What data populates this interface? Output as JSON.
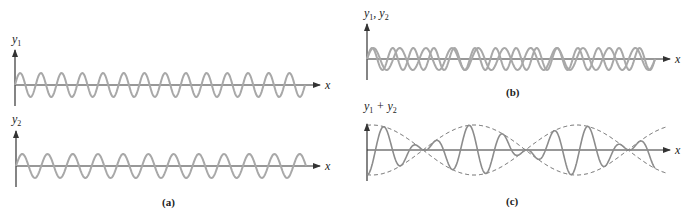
{
  "figure": {
    "panels": [
      {
        "id": "a",
        "caption": "(a)",
        "subplots": [
          {
            "ylabel": "y",
            "ylabel_sub": "1",
            "xlabel": "x",
            "description": "single sinusoidal wave y1, higher frequency",
            "cycles": 14
          },
          {
            "ylabel": "y",
            "ylabel_sub": "2",
            "xlabel": "x",
            "description": "single sinusoidal wave y2, lower frequency",
            "cycles": 11
          }
        ]
      },
      {
        "id": "b",
        "caption": "(b)",
        "ylabel": "y1, y2",
        "ylabel_parts": [
          "y",
          "1",
          ", y",
          "2"
        ],
        "xlabel": "x",
        "description": "y1 and y2 overlaid showing moving in and out of phase"
      },
      {
        "id": "c",
        "caption": "(c)",
        "ylabel": "y1 + y2",
        "ylabel_parts": [
          "y",
          "1",
          " + y",
          "2"
        ],
        "xlabel": "x",
        "description": "superposition y1 + y2 showing beats with dashed amplitude envelope"
      }
    ],
    "colors": {
      "wave": "#a8a8a8",
      "wave_sum": "#8c8c8c",
      "axis": "#333333",
      "envelope": "#555555",
      "text": "#222222"
    }
  },
  "chart_data": [
    {
      "type": "line",
      "title": "(a) y1",
      "xlabel": "x",
      "ylabel": "y1",
      "series": [
        {
          "name": "y1",
          "function": "A sin(2π x / λ1)",
          "amplitude": 1,
          "cycles": 14
        }
      ],
      "grid": false
    },
    {
      "type": "line",
      "title": "(a) y2",
      "xlabel": "x",
      "ylabel": "y2",
      "series": [
        {
          "name": "y2",
          "function": "A sin(2π x / λ2)",
          "amplitude": 1,
          "cycles": 11
        }
      ],
      "grid": false
    },
    {
      "type": "line",
      "title": "(b)",
      "xlabel": "x",
      "ylabel": "y1, y2",
      "series": [
        {
          "name": "y1",
          "amplitude": 1,
          "cycles": 14
        },
        {
          "name": "y2",
          "amplitude": 1,
          "cycles": 11
        }
      ],
      "grid": false
    },
    {
      "type": "line",
      "title": "(c)",
      "xlabel": "x",
      "ylabel": "y1 + y2",
      "series": [
        {
          "name": "y1 + y2",
          "amplitude": 2,
          "style": "solid"
        },
        {
          "name": "envelope",
          "style": "dashed",
          "nodes": 3
        }
      ],
      "grid": false
    }
  ]
}
